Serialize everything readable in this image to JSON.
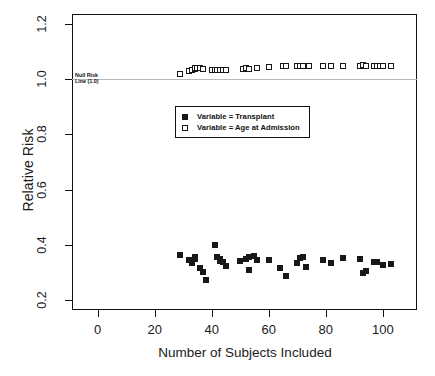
{
  "chart_data": {
    "type": "scatter",
    "title": "",
    "xlabel": "Number of Subjects Included",
    "ylabel": "Relative Risk",
    "xlim": [
      -9,
      112
    ],
    "ylim": [
      0.165,
      1.235
    ],
    "xticks": [
      0,
      20,
      40,
      60,
      80,
      100
    ],
    "yticks": [
      0.2,
      0.4,
      0.6,
      0.8,
      1.0,
      1.2
    ],
    "xtick_labels": [
      "0",
      "20",
      "40",
      "60",
      "80",
      "100"
    ],
    "ytick_labels": [
      "0.2",
      "0.4",
      "0.6",
      "0.8",
      "1.0",
      "1.2"
    ],
    "grid": false,
    "legend_position": "center",
    "annotations": [
      {
        "name": "null-risk-line",
        "text_line1": "Null Risk",
        "text_line2": "Line (1.0)",
        "y": 1.0,
        "color": "#b9b9b9"
      }
    ],
    "series": [
      {
        "name": "Variable = Transplant",
        "marker": "filled-square",
        "color": "#17181a",
        "points": [
          [
            29,
            0.365
          ],
          [
            32,
            0.345
          ],
          [
            33,
            0.334
          ],
          [
            34,
            0.358
          ],
          [
            34,
            0.349
          ],
          [
            36,
            0.318
          ],
          [
            37,
            0.301
          ],
          [
            38,
            0.272
          ],
          [
            41,
            0.401
          ],
          [
            42,
            0.358
          ],
          [
            43,
            0.35
          ],
          [
            43,
            0.341
          ],
          [
            44,
            0.34
          ],
          [
            45,
            0.323
          ],
          [
            50,
            0.343
          ],
          [
            52,
            0.349
          ],
          [
            53,
            0.357
          ],
          [
            53,
            0.311
          ],
          [
            55,
            0.361
          ],
          [
            56,
            0.345
          ],
          [
            60,
            0.346
          ],
          [
            64,
            0.317
          ],
          [
            66,
            0.287
          ],
          [
            70,
            0.334
          ],
          [
            71,
            0.352
          ],
          [
            72,
            0.358
          ],
          [
            73,
            0.32
          ],
          [
            79,
            0.344
          ],
          [
            82,
            0.334
          ],
          [
            86,
            0.352
          ],
          [
            92,
            0.349
          ],
          [
            93,
            0.299
          ],
          [
            94,
            0.306
          ],
          [
            97,
            0.34
          ],
          [
            98,
            0.337
          ],
          [
            100,
            0.329
          ],
          [
            103,
            0.333
          ]
        ]
      },
      {
        "name": "Variable = Age at Admission",
        "marker": "open-square",
        "color": "#17181a",
        "points": [
          [
            29,
            1.018
          ],
          [
            32,
            1.03
          ],
          [
            33,
            1.032
          ],
          [
            34,
            1.035
          ],
          [
            34,
            1.038
          ],
          [
            35,
            1.04
          ],
          [
            36,
            1.038
          ],
          [
            37,
            1.036
          ],
          [
            40,
            1.032
          ],
          [
            41,
            1.031
          ],
          [
            42,
            1.032
          ],
          [
            43,
            1.033
          ],
          [
            44,
            1.031
          ],
          [
            45,
            1.032
          ],
          [
            51,
            1.036
          ],
          [
            52,
            1.038
          ],
          [
            53,
            1.035
          ],
          [
            53,
            1.037
          ],
          [
            56,
            1.04
          ],
          [
            60,
            1.042
          ],
          [
            65,
            1.047
          ],
          [
            66,
            1.048
          ],
          [
            70,
            1.046
          ],
          [
            71,
            1.046
          ],
          [
            72,
            1.046
          ],
          [
            74,
            1.047
          ],
          [
            79,
            1.047
          ],
          [
            82,
            1.046
          ],
          [
            86,
            1.047
          ],
          [
            92,
            1.048
          ],
          [
            93,
            1.049
          ],
          [
            94,
            1.047
          ],
          [
            97,
            1.048
          ],
          [
            98,
            1.048
          ],
          [
            99,
            1.048
          ],
          [
            100,
            1.047
          ],
          [
            103,
            1.047
          ]
        ]
      }
    ],
    "legend": [
      {
        "label": "Variable = Transplant",
        "marker": "filled-square"
      },
      {
        "label": "Variable = Age at Admission",
        "marker": "open-square"
      }
    ]
  }
}
